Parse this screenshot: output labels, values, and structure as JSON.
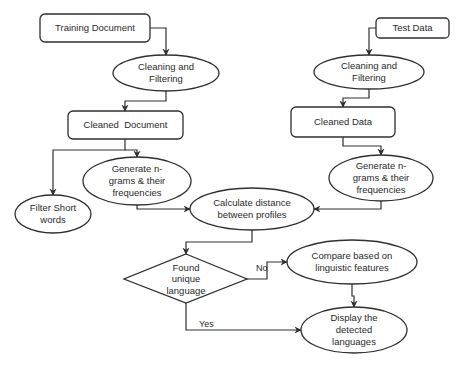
{
  "diagram": {
    "type": "flowchart",
    "nodes": {
      "training_document": {
        "shape": "rounded-rect",
        "label": "Training Document"
      },
      "cleaning_left": {
        "shape": "ellipse",
        "label_line1": "Cleaning and",
        "label_line2": "Filtering"
      },
      "cleaned_document": {
        "shape": "rounded-rect",
        "label": "Cleaned  Document"
      },
      "filter_short": {
        "shape": "ellipse",
        "label_line1": "Filter Short",
        "label_line2": "words"
      },
      "generate_left": {
        "shape": "ellipse",
        "label_line1": "Generate n-",
        "label_line2": "grams & their",
        "label_line3": "frequencies"
      },
      "test_data": {
        "shape": "rounded-rect",
        "label": "Test Data"
      },
      "cleaning_right": {
        "shape": "ellipse",
        "label_line1": "Cleaning and",
        "label_line2": "Filtering"
      },
      "cleaned_data": {
        "shape": "rounded-rect",
        "label": "Cleaned Data"
      },
      "generate_right": {
        "shape": "ellipse",
        "label_line1": "Generate n-",
        "label_line2": "grams & their",
        "label_line3": "frequencies"
      },
      "calculate_distance": {
        "shape": "ellipse",
        "label_line1": "Calculate distance",
        "label_line2": "between profiles"
      },
      "found_unique": {
        "shape": "diamond",
        "label_line1": "Found",
        "label_line2": "unique",
        "label_line3": "language"
      },
      "compare_linguistic": {
        "shape": "ellipse",
        "label_line1": "Compare based on",
        "label_line2": "linguistic features"
      },
      "display_detected": {
        "shape": "ellipse",
        "label_line1": "Display the",
        "label_line2": "detected",
        "label_line3": "languages"
      }
    },
    "edges": [
      {
        "from": "Training Document",
        "to": "Cleaning and Filtering (left)"
      },
      {
        "from": "Cleaning and Filtering (left)",
        "to": "Cleaned Document"
      },
      {
        "from": "Cleaned Document",
        "to": "Filter Short words"
      },
      {
        "from": "Cleaned Document",
        "to": "Generate n-grams & their frequencies (left)"
      },
      {
        "from": "Generate n-grams & their frequencies (left)",
        "to": "Calculate distance between profiles"
      },
      {
        "from": "Test Data",
        "to": "Cleaning and Filtering (right)"
      },
      {
        "from": "Cleaning and Filtering (right)",
        "to": "Cleaned Data"
      },
      {
        "from": "Cleaned Data",
        "to": "Generate n-grams & their frequencies (right)"
      },
      {
        "from": "Generate n-grams & their frequencies (right)",
        "to": "Calculate distance between profiles"
      },
      {
        "from": "Calculate distance between profiles",
        "to": "Found unique language"
      },
      {
        "from": "Found unique language",
        "to": "Compare based on linguistic features",
        "label": "No"
      },
      {
        "from": "Found unique language",
        "to": "Display the detected languages",
        "label": "Yes"
      },
      {
        "from": "Compare based on linguistic features",
        "to": "Display the detected languages"
      }
    ],
    "edge_labels": {
      "no": "No",
      "yes": "Yes"
    },
    "colors": {
      "stroke": "#2f2f2f",
      "fill": "#ffffff",
      "text": "#2a2a2a"
    }
  }
}
